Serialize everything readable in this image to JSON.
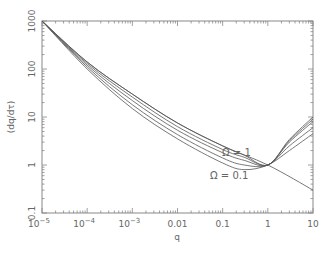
{
  "chart_data": {
    "type": "line",
    "title": "",
    "xlabel": "q",
    "ylabel": "(dq/dτ)",
    "xscale": "log",
    "yscale": "log",
    "xlim": [
      1e-05,
      10
    ],
    "ylim": [
      0.1,
      1000
    ],
    "grid": false,
    "x_ticks": [
      "10^-5",
      "10^-4",
      "10^-3",
      "0.01",
      "0.1",
      "1",
      "10"
    ],
    "y_ticks": [
      "0.1",
      "1",
      "10",
      "100",
      "1000"
    ],
    "annotations": [
      {
        "text": "Ω = 1",
        "x": 0.5,
        "y": 2.2
      },
      {
        "text": "Ω = 0.1",
        "x": 0.15,
        "y": 0.3
      }
    ],
    "series": [
      {
        "name": "Ω = 0.1",
        "x": [
          1e-05,
          0.0001,
          0.001,
          0.01,
          0.1,
          0.3,
          1,
          3,
          10
        ],
        "y": [
          1000,
          100,
          15,
          3.5,
          1.1,
          0.8,
          1.0,
          2.0,
          4.5
        ]
      },
      {
        "name": "Ω = 0.2",
        "x": [
          1e-05,
          0.0001,
          0.001,
          0.01,
          0.1,
          0.3,
          1,
          3,
          10
        ],
        "y": [
          1000,
          110,
          18,
          4.3,
          1.4,
          1.0,
          1.0,
          2.5,
          6.0
        ]
      },
      {
        "name": "Ω = 0.4",
        "x": [
          1e-05,
          0.0001,
          0.001,
          0.01,
          0.1,
          0.3,
          1,
          3,
          10
        ],
        "y": [
          1000,
          120,
          22,
          5.3,
          1.8,
          1.25,
          1.0,
          3.0,
          8.0
        ]
      },
      {
        "name": "Ω = 0.6",
        "x": [
          1e-05,
          0.0001,
          0.001,
          0.01,
          0.1,
          0.3,
          1,
          3,
          10
        ],
        "y": [
          1000,
          130,
          26,
          6.3,
          2.1,
          1.45,
          1.0,
          3.2,
          9.0
        ]
      },
      {
        "name": "Ω = 1",
        "x": [
          1e-05,
          0.0001,
          0.001,
          0.01,
          0.1,
          0.3,
          1,
          3,
          10
        ],
        "y": [
          1000,
          140,
          30,
          7.5,
          2.5,
          1.6,
          1.0,
          3.4,
          10.0
        ]
      },
      {
        "name": "asymptote",
        "x": [
          1e-05,
          0.0001,
          0.001,
          0.01,
          0.1,
          1,
          10
        ],
        "y": [
          1000,
          140,
          30,
          7.5,
          2.5,
          1.0,
          0.3
        ]
      }
    ]
  },
  "labels": {
    "xlabel": "q",
    "ylabel": "(dq/dτ)",
    "omega_top": "Ω = 1",
    "omega_bottom": "Ω = 0.1",
    "x_ticks": [
      "10",
      "10",
      "10",
      "0.01",
      "0.1",
      "1",
      "10"
    ],
    "x_exps": [
      "−5",
      "−4",
      "−3",
      "",
      "",
      "",
      ""
    ],
    "y_ticks": [
      "0.1",
      "1",
      "10",
      "100",
      "1000"
    ]
  }
}
